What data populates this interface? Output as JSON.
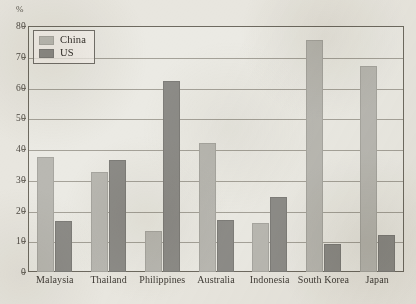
{
  "chart_data": {
    "type": "bar",
    "title": "",
    "subtitle": "",
    "xlabel": "",
    "ylabel": "%",
    "unit_label": "%",
    "ylim": [
      0,
      80
    ],
    "ytick_step": 10,
    "yticks": [
      0,
      10,
      20,
      30,
      40,
      50,
      60,
      70,
      80
    ],
    "ytick_labels": [
      "0",
      "10",
      "20",
      "30",
      "40",
      "50",
      "60",
      "70",
      "80"
    ],
    "grid": true,
    "legend_position": "top-left",
    "categories": [
      "Malaysia",
      "Thailand",
      "Philippines",
      "Australia",
      "Indonesia",
      "South Korea",
      "Japan"
    ],
    "series": [
      {
        "name": "China",
        "color": "#b9b8b2",
        "values": [
          37.5,
          32.5,
          13.5,
          42,
          16,
          75.5,
          67
        ]
      },
      {
        "name": "US",
        "color": "#8d8c88",
        "values": [
          16.5,
          36.5,
          62,
          17,
          24.5,
          9,
          12
        ]
      }
    ]
  },
  "legend": {
    "items": [
      {
        "label": "China",
        "swatch": "china"
      },
      {
        "label": "US",
        "swatch": "us"
      }
    ]
  },
  "colors": {
    "paper": "#e8e6df",
    "axis": "#6e6a60",
    "gridline": "#8d8a80",
    "china_bar": "#b9b8b2",
    "us_bar": "#8d8c88",
    "text": "#3f3b35"
  }
}
